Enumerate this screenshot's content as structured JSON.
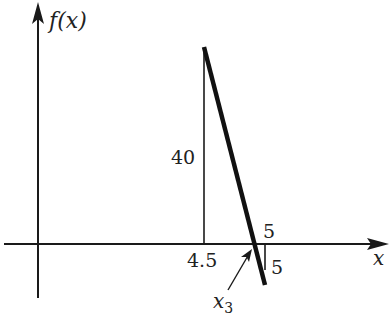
{
  "diagram": {
    "y_axis_label": "f(x)",
    "x_axis_label": "x",
    "labels": {
      "height": "40",
      "x_start": "4.5",
      "x_end_top": "5",
      "x_end_side": "5",
      "root": "x",
      "root_subscript": "3"
    },
    "colors": {
      "ink": "#1a1a1a",
      "background": "#ffffff"
    },
    "geometry_description": "Line from (4.5, 40) descending through x-axis at x3 to (5, -5); vertical drop at x=4.5 to height 40 and small vertical segment at x=5."
  }
}
